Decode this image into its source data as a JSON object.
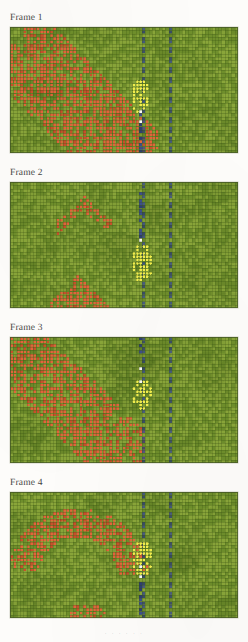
{
  "document": {
    "kind": "figure-page",
    "background_color": "#fdfcfa",
    "bottom_caption_fragment": "· ·  ·   ·  ·  ·"
  },
  "palette": {
    "grass_light": "#8aa63a",
    "grass_dark": "#6f8f2c",
    "grid_line": "#4d6a1f",
    "agent_red": "#e2653c",
    "agent_red_dark": "#c9502c",
    "agent_yellow": "#f2ee4e",
    "agent_blue": "#3d4f8c",
    "agent_blue_dark": "#2f3f72",
    "agent_white": "#fcfcf4",
    "panel_border": "#7b8a5c"
  },
  "grid": {
    "cols": 69,
    "rows": 38,
    "cell_px": 3.3,
    "wall_columns": [
      40,
      48
    ],
    "wall_dash_period": 3,
    "wall_dash_on": 2
  },
  "frames": [
    {
      "label": "Frame 1",
      "label_x": 10,
      "label_y": 13,
      "panel_x": 10,
      "panel_y": 27,
      "panel_w": 228,
      "panel_h": 126,
      "seed": 1101,
      "red_bands": [
        {
          "type": "diag",
          "a": 1.0,
          "b": -4,
          "half_width": 7.0,
          "x0": 4,
          "x1": 44,
          "density": 0.72
        },
        {
          "type": "diag",
          "a": 1.0,
          "b": 12,
          "half_width": 6.0,
          "x0": 0,
          "x1": 30,
          "density": 0.66
        }
      ],
      "yellow_cluster": {
        "cx": 39.0,
        "cy": 20.5,
        "rx": 3.0,
        "ry": 5.0,
        "density": 0.42
      },
      "white_cells": [
        [
          39,
          25
        ],
        [
          39,
          28
        ]
      ],
      "blue_stub": {
        "col": 39,
        "row_start": 26,
        "row_end": 38
      }
    },
    {
      "label": "Frame 2",
      "label_x": 10,
      "label_y": 168,
      "panel_x": 10,
      "panel_y": 182,
      "panel_w": 228,
      "panel_h": 126,
      "seed": 2202,
      "red_bands": [
        {
          "type": "vee",
          "apex_x": 22,
          "apex_y": 6,
          "slope": 0.9,
          "half_width": 2.2,
          "x0": 14,
          "x1": 30,
          "density": 0.55
        },
        {
          "type": "vee",
          "apex_x": 20,
          "apex_y": 33,
          "slope": 1.05,
          "half_width": 5.5,
          "x0": 0,
          "x1": 40,
          "density": 0.7
        }
      ],
      "yellow_cluster": {
        "cx": 39.5,
        "cy": 24.0,
        "rx": 3.2,
        "ry": 6.0,
        "density": 0.48
      },
      "white_cells": [
        [
          39,
          17
        ]
      ],
      "blue_stub": {
        "col": 39,
        "row_start": 3,
        "row_end": 18
      }
    },
    {
      "label": "Frame 3",
      "label_x": 10,
      "label_y": 323,
      "panel_x": 10,
      "panel_y": 337,
      "panel_w": 228,
      "panel_h": 126,
      "seed": 3303,
      "red_bands": [
        {
          "type": "diag",
          "a": 0.95,
          "b": -2,
          "half_width": 6.5,
          "x0": 0,
          "x1": 40,
          "density": 0.62
        },
        {
          "type": "diag",
          "a": 1.0,
          "b": 8,
          "half_width": 5.0,
          "x0": 0,
          "x1": 38,
          "density": 0.68
        }
      ],
      "yellow_cluster": {
        "cx": 39.5,
        "cy": 17.0,
        "rx": 3.0,
        "ry": 5.0,
        "density": 0.45
      },
      "white_cells": [
        [
          39,
          9
        ],
        [
          39,
          13
        ]
      ],
      "blue_stub": {
        "col": 39,
        "row_start": 0,
        "row_end": 5
      }
    },
    {
      "label": "Frame 4",
      "label_x": 10,
      "label_y": 478,
      "panel_x": 10,
      "panel_y": 492,
      "panel_w": 228,
      "panel_h": 126,
      "seed": 4404,
      "red_bands": [
        {
          "type": "arc",
          "cx": 20,
          "cy": 26,
          "r": 17.0,
          "half_width": 4.5,
          "a0": 190,
          "a1": 355,
          "density": 0.68
        },
        {
          "type": "blob",
          "cx": 22,
          "cy": 36,
          "rx": 6.0,
          "ry": 3.0,
          "density": 0.55
        }
      ],
      "yellow_cluster": {
        "cx": 39.5,
        "cy": 19.5,
        "rx": 3.0,
        "ry": 5.5,
        "density": 0.47
      },
      "white_cells": [
        [
          39,
          22
        ],
        [
          39,
          25
        ]
      ],
      "blue_stub": {
        "col": 39,
        "row_start": 23,
        "row_end": 38
      }
    }
  ]
}
